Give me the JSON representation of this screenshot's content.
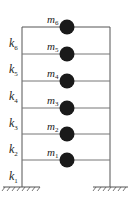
{
  "diagram": {
    "colors": {
      "line": "#555555",
      "mass": "#1a1a1a",
      "text": "#222222"
    },
    "frame": {
      "left_x": 22,
      "right_x": 110,
      "ground_y": 187,
      "top_y": 27
    },
    "floors": [
      {
        "y": 160,
        "mass": "m",
        "mass_sub": "1"
      },
      {
        "y": 134,
        "mass": "m",
        "mass_sub": "2"
      },
      {
        "y": 108,
        "mass": "m",
        "mass_sub": "3"
      },
      {
        "y": 81,
        "mass": "m",
        "mass_sub": "4"
      },
      {
        "y": 54,
        "mass": "m",
        "mass_sub": "5"
      },
      {
        "y": 27,
        "mass": "m",
        "mass_sub": "6"
      }
    ],
    "springs": [
      {
        "label": "k",
        "sub": "1",
        "y": 177
      },
      {
        "label": "k",
        "sub": "2",
        "y": 150
      },
      {
        "label": "k",
        "sub": "3",
        "y": 124
      },
      {
        "label": "k",
        "sub": "4",
        "y": 97
      },
      {
        "label": "k",
        "sub": "5",
        "y": 70
      },
      {
        "label": "k",
        "sub": "6",
        "y": 44
      }
    ],
    "ground_supports": [
      "fixed-left",
      "fixed-right"
    ]
  }
}
